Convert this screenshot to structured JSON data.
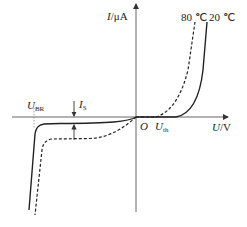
{
  "diagram": {
    "axes": {
      "y_label_var": "I",
      "y_label_unit": "/μA",
      "x_label_var": "U",
      "x_label_unit": "/V",
      "origin_label": "O"
    },
    "annotations": {
      "breakdown_var": "U",
      "breakdown_sub": "BR",
      "saturation_var": "I",
      "saturation_sub": "S",
      "threshold_var": "U",
      "threshold_sub": "th"
    },
    "curves": [
      {
        "name": "80 ℃",
        "style": "dashed"
      },
      {
        "name": "20 ℃",
        "style": "solid"
      }
    ],
    "colors": {
      "line": "#222222",
      "axis": "#555555"
    }
  }
}
